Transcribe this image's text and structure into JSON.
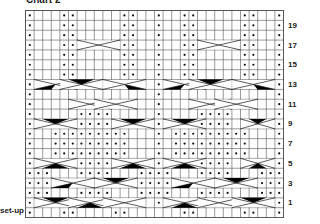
{
  "title": "Chart 2",
  "setup_label": "set-up",
  "grid": {
    "columns": 30,
    "rows_top_to_bottom": [
      "20",
      "19",
      "18",
      "17",
      "16",
      "15",
      "14",
      "13",
      "12",
      "11",
      "10",
      "9",
      "8",
      "7",
      "6",
      "5",
      "4",
      "3",
      "2",
      "1",
      "set-up"
    ],
    "right_labels": [
      "19",
      "17",
      "15",
      "13",
      "11",
      "9",
      "7",
      "5",
      "3",
      "1"
    ],
    "cell_w": 8.6,
    "cell_h": 9.86,
    "line_color": "#555555",
    "dot_color": "#111111"
  },
  "row_dots": {
    "20": [
      1,
      5,
      6,
      12,
      13,
      16,
      19,
      20,
      26,
      27,
      30
    ],
    "19": [
      1,
      5,
      6,
      12,
      13,
      16,
      19,
      20,
      26,
      27,
      30
    ],
    "18": [
      1,
      5,
      6,
      12,
      13,
      16,
      19,
      20,
      26,
      27,
      30
    ],
    "17": [
      1,
      5,
      6,
      12,
      13,
      16,
      19,
      20,
      26,
      27,
      30
    ],
    "16": [
      1,
      5,
      6,
      12,
      13,
      16,
      19,
      20,
      26,
      27,
      30
    ],
    "15": [
      1,
      5,
      6,
      12,
      13,
      16,
      19,
      20,
      26,
      27,
      30
    ],
    "14": [
      1,
      5,
      6,
      12,
      13,
      16,
      19,
      20,
      26,
      27,
      30
    ],
    "13": [
      1,
      16,
      30
    ],
    "12": [
      1,
      16,
      30
    ],
    "11": [
      1,
      16,
      30
    ],
    "10": [
      1,
      7,
      8,
      9,
      10,
      16,
      21,
      22,
      23,
      24,
      30
    ],
    "9": [
      1,
      7,
      8,
      9,
      10,
      16,
      21,
      22,
      23,
      24,
      30
    ],
    "8": [
      1,
      4,
      5,
      6,
      7,
      8,
      9,
      10,
      11,
      12,
      16,
      18,
      19,
      20,
      21,
      22,
      23,
      24,
      25,
      26,
      30
    ],
    "7": [
      1,
      4,
      5,
      6,
      7,
      8,
      9,
      10,
      11,
      12,
      16,
      18,
      19,
      20,
      21,
      22,
      23,
      24,
      25,
      26,
      30
    ],
    "6": [
      1,
      4,
      5,
      6,
      7,
      8,
      9,
      10,
      11,
      12,
      16,
      18,
      19,
      20,
      21,
      22,
      23,
      24,
      25,
      26,
      30
    ],
    "5": [
      1,
      7,
      8,
      9,
      10,
      16,
      21,
      22,
      23,
      24,
      30
    ],
    "4": [
      1,
      2,
      3,
      7,
      8,
      9,
      10,
      14,
      15,
      16,
      17,
      21,
      22,
      23,
      24,
      28,
      29,
      30
    ],
    "3": [
      1,
      2,
      3,
      14,
      15,
      16,
      17,
      28,
      29,
      30
    ],
    "2": [
      1,
      2,
      3,
      7,
      8,
      9,
      10,
      14,
      15,
      16,
      17,
      21,
      22,
      23,
      24,
      28,
      29,
      30
    ],
    "1": [
      1,
      16,
      30
    ],
    "set-up": [
      1,
      5,
      6,
      11,
      12,
      19,
      20,
      26,
      27,
      30
    ]
  },
  "cables": [
    {
      "row": "17",
      "from": 7,
      "to": 11,
      "type": "open"
    },
    {
      "row": "17",
      "from": 21,
      "to": 25,
      "type": "open"
    },
    {
      "row": "13",
      "from": 2,
      "to": 6,
      "type": "solid-left"
    },
    {
      "row": "13",
      "from": 5,
      "to": 9,
      "type": "solid-top"
    },
    {
      "row": "13",
      "from": 10,
      "to": 14,
      "type": "solid-right"
    },
    {
      "row": "13",
      "from": 17,
      "to": 21,
      "type": "solid-left"
    },
    {
      "row": "13",
      "from": 20,
      "to": 24,
      "type": "solid-top"
    },
    {
      "row": "13",
      "from": 25,
      "to": 29,
      "type": "solid-right"
    },
    {
      "row": "11",
      "from": 6,
      "to": 10,
      "type": "open"
    },
    {
      "row": "11",
      "from": 9,
      "to": 13,
      "type": "open"
    },
    {
      "row": "11",
      "from": 20,
      "to": 24,
      "type": "open"
    },
    {
      "row": "11",
      "from": 23,
      "to": 27,
      "type": "open"
    },
    {
      "row": "9",
      "from": 2,
      "to": 6,
      "type": "solid-top"
    },
    {
      "row": "9",
      "from": 11,
      "to": 15,
      "type": "solid-top"
    },
    {
      "row": "9",
      "from": 17,
      "to": 21,
      "type": "solid-top"
    },
    {
      "row": "9",
      "from": 26,
      "to": 29,
      "type": "solid-top"
    },
    {
      "row": "5",
      "from": 2,
      "to": 6,
      "type": "solid-bottom"
    },
    {
      "row": "5",
      "from": 11,
      "to": 15,
      "type": "solid-bottom"
    },
    {
      "row": "5",
      "from": 17,
      "to": 21,
      "type": "solid-bottom"
    },
    {
      "row": "5",
      "from": 26,
      "to": 29,
      "type": "solid-bottom"
    },
    {
      "row": "3",
      "from": 4,
      "to": 8,
      "type": "solid-left"
    },
    {
      "row": "3",
      "from": 9,
      "to": 13,
      "type": "solid-top"
    },
    {
      "row": "3",
      "from": 18,
      "to": 22,
      "type": "solid-left"
    },
    {
      "row": "3",
      "from": 23,
      "to": 27,
      "type": "solid-top"
    },
    {
      "row": "1",
      "from": 2,
      "to": 6,
      "type": "solid-top"
    },
    {
      "row": "1",
      "from": 6,
      "to": 10,
      "type": "solid-bottom"
    },
    {
      "row": "1",
      "from": 10,
      "to": 14,
      "type": "open"
    },
    {
      "row": "1",
      "from": 17,
      "to": 21,
      "type": "solid-bottom"
    },
    {
      "row": "1",
      "from": 21,
      "to": 25,
      "type": "open"
    },
    {
      "row": "1",
      "from": 25,
      "to": 29,
      "type": "solid-top"
    }
  ]
}
